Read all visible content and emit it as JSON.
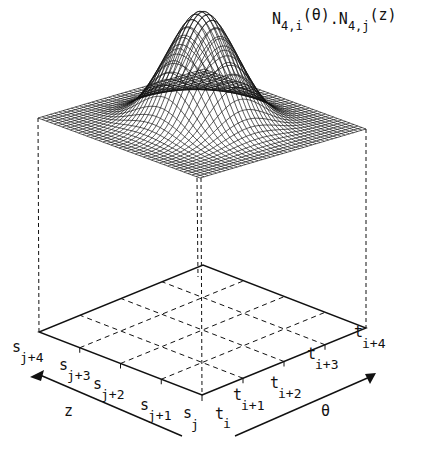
{
  "figure": {
    "title": {
      "text": "N4,i(θ).N4,j(z)",
      "parts": [
        {
          "base": "N",
          "sub": "4,i",
          "arg": "(θ)"
        },
        {
          "sep": "."
        },
        {
          "base": "N",
          "sub": "4,j",
          "arg": "(z)"
        }
      ]
    },
    "surface": {
      "description": "Bicubic B-spline tensor product basis function surface",
      "order": 4,
      "mesh_lines": 40,
      "corners": {
        "left": [
          38,
          118
        ],
        "front": [
          200,
          178
        ],
        "right": [
          366,
          129
        ],
        "back": [
          199,
          60
        ]
      },
      "peak": [
        203,
        11
      ]
    },
    "grid": {
      "corners": {
        "left": [
          39,
          332
        ],
        "front": [
          202,
          395
        ],
        "right": [
          366,
          328
        ],
        "back": [
          199,
          277
        ]
      },
      "divisions": 4
    },
    "z_axis": {
      "label": "z",
      "knots": [
        {
          "base": "s",
          "sub": "j"
        },
        {
          "base": "s",
          "sub": "j+1"
        },
        {
          "base": "s",
          "sub": "j+2"
        },
        {
          "base": "s",
          "sub": "j+3"
        },
        {
          "base": "s",
          "sub": "j+4"
        }
      ]
    },
    "theta_axis": {
      "label": "θ",
      "knots": [
        {
          "base": "t",
          "sub": "i"
        },
        {
          "base": "t",
          "sub": "i+1"
        },
        {
          "base": "t",
          "sub": "i+2"
        },
        {
          "base": "t",
          "sub": "i+3"
        },
        {
          "base": "t",
          "sub": "i+4"
        }
      ]
    },
    "colors": {
      "ink": "#111111",
      "background": "#ffffff"
    }
  }
}
